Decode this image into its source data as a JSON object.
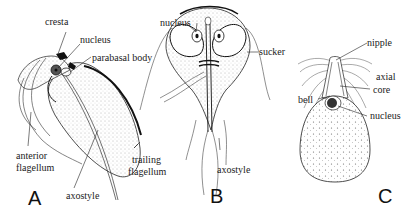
{
  "figure": {
    "panels": [
      {
        "id": "A",
        "label": "A",
        "annotations": {
          "cresta": "cresta",
          "nucleus": "nucleus",
          "parabasal_body": "parabasal body",
          "anterior_flagellum_1": "anterior",
          "anterior_flagellum_2": "flagellum",
          "trailing_flagellum_1": "trailing",
          "trailing_flagellum_2": "flagellum",
          "axostyle": "axostyle"
        }
      },
      {
        "id": "B",
        "label": "B",
        "annotations": {
          "nucleus": "nucleus",
          "sucker": "sucker",
          "axostyle": "axostyle"
        }
      },
      {
        "id": "C",
        "label": "C",
        "annotations": {
          "nipple": "nipple",
          "axial_core_1": "axial",
          "axial_core_2": "core",
          "bell": "bell",
          "nucleus": "nucleus"
        }
      }
    ]
  }
}
